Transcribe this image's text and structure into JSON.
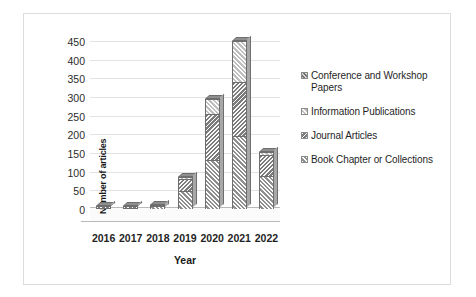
{
  "chart_data": {
    "type": "bar",
    "subtype": "stacked-column-3d",
    "title": "",
    "xlabel": "Year",
    "ylabel": "Number of articles",
    "categories": [
      "2016",
      "2017",
      "2018",
      "2019",
      "2020",
      "2021",
      "2022"
    ],
    "ylim": [
      0,
      450
    ],
    "yticks": [
      0,
      50,
      100,
      150,
      200,
      250,
      300,
      350,
      400,
      450
    ],
    "ytick_labels": [
      "0",
      "50",
      "100",
      "150",
      "200",
      "250",
      "300",
      "350",
      "400",
      "450"
    ],
    "grid": true,
    "legend_position": "right",
    "series": [
      {
        "name": "Book Chapter or Collections",
        "swatch_color": "#c9c9c9",
        "values": [
          2,
          3,
          8,
          48,
          130,
          195,
          88
        ]
      },
      {
        "name": "Journal Articles",
        "swatch_color": "#bdbdbd",
        "values": [
          1,
          1,
          4,
          32,
          125,
          145,
          58
        ]
      },
      {
        "name": "Information Publications",
        "swatch_color": "#ededed",
        "values": [
          0,
          0,
          0,
          5,
          40,
          110,
          6
        ]
      },
      {
        "name": "Conference and Workshop Papers",
        "swatch_color": "#9e9e9e",
        "values": [
          0,
          0,
          0,
          0,
          0,
          0,
          0
        ]
      }
    ],
    "totals": [
      3,
      4,
      12,
      85,
      295,
      450,
      152
    ]
  },
  "axes": {
    "y_title": "Number of articles",
    "x_title": "Year",
    "y_tick_labels": [
      "450",
      "400",
      "350",
      "300",
      "250",
      "200",
      "150",
      "100",
      "50",
      "0"
    ],
    "x_tick_labels": [
      "2016",
      "2017",
      "2018",
      "2019",
      "2020",
      "2021",
      "2022"
    ]
  },
  "legend": {
    "items": [
      {
        "label": "Conference and Workshop Papers",
        "swatch": "legend-swatch-conference"
      },
      {
        "label": "Information Publications",
        "swatch": "legend-swatch-information"
      },
      {
        "label": "Journal Articles",
        "swatch": "legend-swatch-journal"
      },
      {
        "label": "Book Chapter or Collections",
        "swatch": "legend-swatch-book"
      }
    ]
  }
}
